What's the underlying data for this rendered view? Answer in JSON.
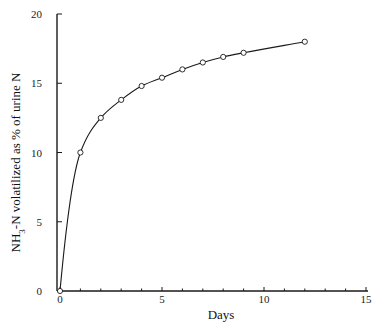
{
  "chart_data": {
    "type": "scatter",
    "title": "",
    "xlabel": "Days",
    "ylabel_parts": [
      "NH",
      "3",
      "-N volatilized as % of urine N"
    ],
    "ylabel": "NH3-N volatilized as % of urine N",
    "xlim": [
      0,
      15
    ],
    "ylim": [
      0,
      20
    ],
    "x_ticks": [
      0,
      5,
      10,
      15
    ],
    "x_minor_ticks": [
      1,
      2,
      3,
      4,
      6,
      7,
      8,
      9,
      11,
      12,
      13,
      14
    ],
    "y_ticks": [
      0,
      5,
      10,
      15,
      20
    ],
    "grid": false,
    "legend": "none",
    "series": [
      {
        "name": "observed",
        "marker": "open-circle",
        "x": [
          0,
          1,
          2,
          3,
          4,
          5,
          6,
          7,
          8,
          9,
          12
        ],
        "y": [
          0,
          10.0,
          12.5,
          13.8,
          14.8,
          15.4,
          16.0,
          16.5,
          16.9,
          17.2,
          18.0
        ]
      }
    ],
    "fitted_curve": {
      "name": "fitted",
      "style": "solid-line",
      "description": "smooth saturating curve through the observations"
    }
  }
}
